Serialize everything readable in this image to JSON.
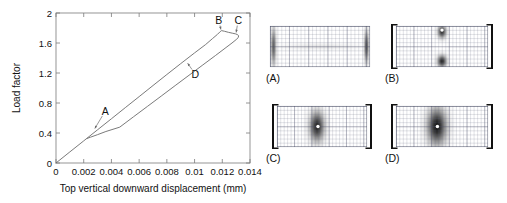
{
  "figure": {
    "name": "load-displacement-curve-with-deformation-panels",
    "background_color": "#ffffff",
    "line_color": "#555555",
    "text_color": "#111111"
  },
  "chart_data": {
    "type": "line",
    "title": "",
    "xlabel": "Top vertical downward displacement (mm)",
    "ylabel": "Load factor",
    "xlim": [
      0,
      0.014
    ],
    "ylim": [
      0,
      2
    ],
    "xticks": [
      0,
      0.002,
      0.004,
      0.006,
      0.008,
      0.01,
      0.012,
      0.014
    ],
    "xtick_labels": [
      "0",
      "0.002",
      "0.004",
      "0.006",
      "0.008",
      "0.01",
      "0.012",
      "0.014"
    ],
    "yticks": [
      0,
      0.4,
      0.8,
      1.2,
      1.6,
      2
    ],
    "ytick_labels": [
      "0",
      "0.4",
      "0.8",
      "1.2",
      "1.6",
      "2"
    ],
    "grid": false,
    "legend": "none",
    "series": [
      {
        "name": "equilibrium-path",
        "points": [
          [
            0.0,
            0.0
          ],
          [
            0.001,
            0.148
          ],
          [
            0.002,
            0.295
          ],
          [
            0.003,
            0.443
          ],
          [
            0.004,
            0.59
          ],
          [
            0.005,
            0.738
          ],
          [
            0.006,
            0.885
          ],
          [
            0.007,
            1.033
          ],
          [
            0.008,
            1.18
          ],
          [
            0.009,
            1.325
          ],
          [
            0.01,
            1.468
          ],
          [
            0.0108,
            1.58
          ],
          [
            0.0113,
            1.66
          ],
          [
            0.01165,
            1.715
          ],
          [
            0.01185,
            1.752
          ],
          [
            0.01195,
            1.765
          ],
          [
            0.01215,
            1.757
          ],
          [
            0.01245,
            1.742
          ],
          [
            0.01275,
            1.73
          ],
          [
            0.01295,
            1.722
          ],
          [
            0.0131,
            1.712
          ],
          [
            0.01318,
            1.695
          ],
          [
            0.01315,
            1.672
          ],
          [
            0.013,
            1.645
          ],
          [
            0.0127,
            1.6
          ],
          [
            0.0122,
            1.53
          ],
          [
            0.0115,
            1.432
          ],
          [
            0.0106,
            1.308
          ],
          [
            0.0096,
            1.17
          ],
          [
            0.0086,
            1.032
          ],
          [
            0.0076,
            0.893
          ],
          [
            0.0066,
            0.755
          ],
          [
            0.0056,
            0.617
          ],
          [
            0.0046,
            0.478
          ],
          [
            0.0036,
            0.42
          ],
          [
            0.003,
            0.378
          ],
          [
            0.0025,
            0.345
          ],
          [
            0.00225,
            0.328
          ]
        ]
      }
    ],
    "annotations": [
      {
        "label": "A",
        "x": 0.00355,
        "y": 0.69,
        "arrow_to_x": 0.0028,
        "arrow_to_y": 0.46
      },
      {
        "label": "B",
        "x": 0.01175,
        "y": 1.905,
        "arrow_to_x": 0.0119,
        "arrow_to_y": 1.78
      },
      {
        "label": "C",
        "x": 0.01315,
        "y": 1.905,
        "arrow_to_x": 0.013,
        "arrow_to_y": 1.74
      },
      {
        "label": "D",
        "x": 0.01005,
        "y": 1.185,
        "arrow_to_x": 0.0095,
        "arrow_to_y": 1.33
      }
    ]
  },
  "panels": [
    {
      "id": "panel-a",
      "caption": "(A)",
      "supports": false,
      "state": "undeformed-uniform-mesh",
      "hotspots": [
        {
          "cx": 0.035,
          "cy": 0.5,
          "rx": 0.035,
          "ry": 0.58,
          "intensity": 0.62
        },
        {
          "cx": 0.965,
          "cy": 0.5,
          "rx": 0.03,
          "ry": 0.52,
          "intensity": 0.7
        },
        {
          "cx": 0.5,
          "cy": 0.5,
          "rx": 0.5,
          "ry": 0.1,
          "intensity": 0.1
        }
      ]
    },
    {
      "id": "panel-b",
      "caption": "(B)",
      "supports": true,
      "state": "localized-top-and-bottom-bands",
      "hotspots": [
        {
          "cx": 0.5,
          "cy": 0.14,
          "rx": 0.06,
          "ry": 0.2,
          "intensity": 0.82
        },
        {
          "cx": 0.5,
          "cy": 0.86,
          "rx": 0.065,
          "ry": 0.19,
          "intensity": 0.86
        }
      ],
      "white_dot": {
        "cx": 0.5,
        "cy": 0.1
      }
    },
    {
      "id": "panel-c",
      "caption": "(C)",
      "supports": true,
      "state": "diamond-shaped-localization",
      "hotspots": [
        {
          "cx": 0.445,
          "cy": 0.5,
          "rx": 0.105,
          "ry": 0.47,
          "intensity": 0.88
        }
      ],
      "white_dot": {
        "cx": 0.455,
        "cy": 0.5
      }
    },
    {
      "id": "panel-d",
      "caption": "(D)",
      "supports": true,
      "state": "broad-diamond-localization",
      "hotspots": [
        {
          "cx": 0.445,
          "cy": 0.5,
          "rx": 0.135,
          "ry": 0.58,
          "intensity": 0.95
        }
      ],
      "white_dot": {
        "cx": 0.45,
        "cy": 0.5
      }
    }
  ]
}
